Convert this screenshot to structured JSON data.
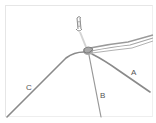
{
  "figure": {
    "type": "knot-diagram",
    "labels": {
      "a": "A",
      "b": "B",
      "c": "C"
    },
    "colors": {
      "cord": "#8a8a8a",
      "cord_light": "#b8b8b8",
      "label": "#555555",
      "frame": "#e6e6e6",
      "background": "#ffffff"
    }
  }
}
